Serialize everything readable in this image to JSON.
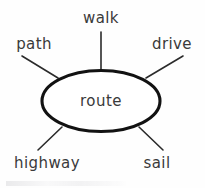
{
  "diagram": {
    "type": "word-web",
    "background_color": "#fefefe",
    "ink_color": "#2b2b2b",
    "outline_color": "#121212",
    "center": {
      "label": "route",
      "shape": "ellipse",
      "cx": 101,
      "cy": 101,
      "rx": 59,
      "ry": 30.5
    },
    "spokes": [
      {
        "id": "walk",
        "label": "walk",
        "position": "top",
        "label_x": 101,
        "label_y": 18,
        "line": {
          "x1": 101,
          "y1": 32,
          "x2": 101,
          "y2": 70
        }
      },
      {
        "id": "path",
        "label": "path",
        "position": "upper-left",
        "label_x": 34,
        "label_y": 44,
        "line": {
          "x1": 22,
          "y1": 56,
          "x2": 58,
          "y2": 78
        }
      },
      {
        "id": "drive",
        "label": "drive",
        "position": "upper-right",
        "label_x": 172,
        "label_y": 44,
        "line": {
          "x1": 183,
          "y1": 56,
          "x2": 146,
          "y2": 78
        }
      },
      {
        "id": "highway",
        "label": "highway",
        "position": "lower-left",
        "label_x": 47,
        "label_y": 163,
        "line": {
          "x1": 62,
          "y1": 127,
          "x2": 38,
          "y2": 150
        }
      },
      {
        "id": "sail",
        "label": "sail",
        "position": "lower-right",
        "label_x": 157,
        "label_y": 163,
        "line": {
          "x1": 139,
          "y1": 127,
          "x2": 163,
          "y2": 150
        }
      }
    ]
  }
}
